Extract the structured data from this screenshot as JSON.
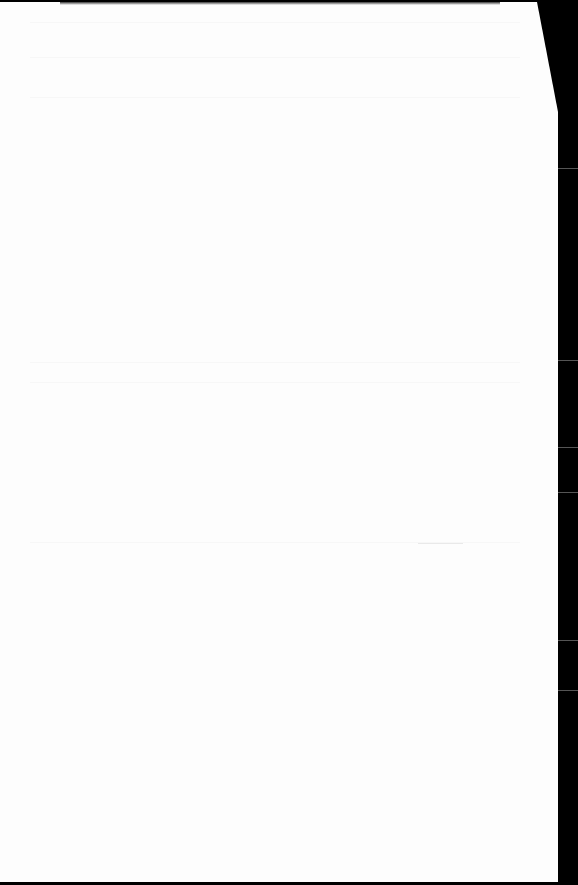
{
  "document": {
    "type": "scanned-page",
    "content": "",
    "description": "Blank page with faint bleed-through, folded top-right corner"
  },
  "colors": {
    "page": "#fdfdfd",
    "background": "#000000"
  }
}
